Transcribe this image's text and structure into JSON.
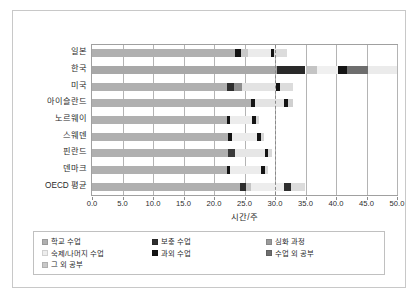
{
  "chart_data": {
    "type": "bar",
    "orientation": "horizontal",
    "stacked": true,
    "title": "",
    "subtitle": "",
    "xlabel": "시간/주",
    "ylabel": "",
    "xlim": [
      0.0,
      50.0
    ],
    "xticks": [
      "0.0",
      "5.0",
      "10.0",
      "15.0",
      "20.0",
      "25.0",
      "30.0",
      "35.0",
      "40.0",
      "45.0",
      "50.0"
    ],
    "xtick_values": [
      0,
      5,
      10,
      15,
      20,
      25,
      30,
      35,
      40,
      45,
      50
    ],
    "grid": true,
    "grid_axis": "x",
    "legend_position": "bottom",
    "annotations": [
      {
        "name": "reference-line",
        "type": "vertical-dashed",
        "value": 30.0,
        "color": "#8a8a8a"
      }
    ],
    "categories": [
      "일본",
      "한국",
      "미국",
      "아이슬란드",
      "노르웨이",
      "스웨덴",
      "핀란드",
      "덴마크",
      "OECD 평균"
    ],
    "series": [
      {
        "name": "학교 수업",
        "color": "#b0b0b0",
        "values": [
          23.4,
          30.4,
          22.1,
          26.0,
          22.1,
          22.3,
          22.3,
          22.1,
          24.3
        ]
      },
      {
        "name": "보충 수업",
        "color": "#404040",
        "values": [
          0.0,
          4.6,
          0.0,
          0.0,
          0.0,
          0.0,
          1.1,
          0.0,
          1.0
        ]
      },
      {
        "name": "심화 과정",
        "color": "#9a9a9a",
        "values": [
          0.0,
          0.0,
          0.9,
          0.0,
          0.0,
          0.0,
          0.0,
          0.0,
          0.0
        ]
      },
      {
        "name": "숙제/나머지 수업",
        "color": "#e8e8e8",
        "values": [
          4.6,
          2.1,
          7.5,
          5.2,
          4.2,
          4.7,
          4.5,
          5.1,
          5.3
        ]
      },
      {
        "name": "과외 수업",
        "color": "#141414",
        "values": [
          1.0,
          0.0,
          1.1,
          1.0,
          0.9,
          0.9,
          0.0,
          0.9,
          0.0
        ]
      },
      {
        "name": "수업 외 공부",
        "color": "#707070",
        "values": [
          0.0,
          3.5,
          0.0,
          0.0,
          0.0,
          0.0,
          0.0,
          0.0,
          0.0
        ]
      },
      {
        "name": "그 외 공부",
        "color": "#d5d5d5",
        "values": [
          2.6,
          9.4,
          1.4,
          0.8,
          0.0,
          0.3,
          0.6,
          0.2,
          2.6
        ]
      }
    ],
    "bars": [
      {
        "category": "일본",
        "segments": [
          {
            "series": "학교 수업",
            "start": 0.0,
            "end": 23.4,
            "color": "#b0b0b0"
          },
          {
            "series": "과외 수업",
            "start": 23.4,
            "end": 24.4,
            "color": "#141414"
          },
          {
            "series": "숙제/나머지 수업",
            "start": 24.4,
            "end": 25.6,
            "color": "#c9c9c9"
          },
          {
            "series": "그 외 공부",
            "start": 25.6,
            "end": 29.3,
            "color": "#ebebeb"
          },
          {
            "series": "과외 수업",
            "start": 29.3,
            "end": 29.9,
            "color": "#141414"
          },
          {
            "series": "그 외 공부",
            "start": 29.9,
            "end": 32.0,
            "color": "#dcdcdc"
          }
        ],
        "total": 32.0
      },
      {
        "category": "한국",
        "segments": [
          {
            "series": "학교 수업",
            "start": 0.0,
            "end": 30.4,
            "color": "#a8a8a8"
          },
          {
            "series": "보충 수업",
            "start": 30.4,
            "end": 35.0,
            "color": "#2a2a2a"
          },
          {
            "series": "숙제/나머지 수업",
            "start": 35.0,
            "end": 36.9,
            "color": "#c4c4c4"
          },
          {
            "series": "그 외 공부",
            "start": 36.9,
            "end": 40.3,
            "color": "#f0f0f0"
          },
          {
            "series": "과외 수업",
            "start": 40.3,
            "end": 41.8,
            "color": "#141414"
          },
          {
            "series": "수업 외 공부",
            "start": 41.8,
            "end": 45.2,
            "color": "#6e6e6e"
          },
          {
            "series": "그 외 공부",
            "start": 45.2,
            "end": 50.0,
            "color": "#ebebeb"
          }
        ],
        "total": 50.0
      },
      {
        "category": "미국",
        "segments": [
          {
            "series": "학교 수업",
            "start": 0.0,
            "end": 22.1,
            "color": "#b0b0b0"
          },
          {
            "series": "보충 수업",
            "start": 22.1,
            "end": 23.2,
            "color": "#2e2e2e"
          },
          {
            "series": "심화 과정",
            "start": 23.2,
            "end": 24.6,
            "color": "#8e8e8e"
          },
          {
            "series": "숙제/나머지 수업",
            "start": 24.6,
            "end": 30.2,
            "color": "#e3e3e3"
          },
          {
            "series": "과외 수업",
            "start": 30.2,
            "end": 30.9,
            "color": "#141414"
          },
          {
            "series": "그 외 공부",
            "start": 30.9,
            "end": 33.0,
            "color": "#dcdcdc"
          }
        ],
        "total": 33.0
      },
      {
        "category": "아이슬란드",
        "segments": [
          {
            "series": "학교 수업",
            "start": 0.0,
            "end": 26.0,
            "color": "#b0b0b0"
          },
          {
            "series": "과외 수업",
            "start": 26.0,
            "end": 26.7,
            "color": "#141414"
          },
          {
            "series": "숙제/나머지 수업",
            "start": 26.7,
            "end": 31.4,
            "color": "#e3e3e3"
          },
          {
            "series": "과외 수업",
            "start": 31.4,
            "end": 32.2,
            "color": "#141414"
          },
          {
            "series": "그 외 공부",
            "start": 32.2,
            "end": 33.0,
            "color": "#d0d0d0"
          }
        ],
        "total": 33.0
      },
      {
        "category": "노르웨이",
        "segments": [
          {
            "series": "학교 수업",
            "start": 0.0,
            "end": 22.1,
            "color": "#b0b0b0"
          },
          {
            "series": "과외 수업",
            "start": 22.1,
            "end": 22.6,
            "color": "#141414"
          },
          {
            "series": "숙제/나머지 수업",
            "start": 22.6,
            "end": 26.3,
            "color": "#ececec"
          },
          {
            "series": "과외 수업",
            "start": 26.3,
            "end": 26.9,
            "color": "#141414"
          },
          {
            "series": "그 외 공부",
            "start": 26.9,
            "end": 27.4,
            "color": "#d8d8d8"
          }
        ],
        "total": 27.4
      },
      {
        "category": "스웨덴",
        "segments": [
          {
            "series": "학교 수업",
            "start": 0.0,
            "end": 22.3,
            "color": "#b0b0b0"
          },
          {
            "series": "과외 수업",
            "start": 22.3,
            "end": 22.9,
            "color": "#141414"
          },
          {
            "series": "숙제/나머지 수업",
            "start": 22.9,
            "end": 27.1,
            "color": "#ececec"
          },
          {
            "series": "과외 수업",
            "start": 27.1,
            "end": 27.7,
            "color": "#141414"
          },
          {
            "series": "그 외 공부",
            "start": 27.7,
            "end": 28.2,
            "color": "#d8d8d8"
          }
        ],
        "total": 28.2
      },
      {
        "category": "핀란드",
        "segments": [
          {
            "series": "학교 수업",
            "start": 0.0,
            "end": 22.3,
            "color": "#b0b0b0"
          },
          {
            "series": "보충 수업",
            "start": 22.3,
            "end": 23.4,
            "color": "#3a3a3a"
          },
          {
            "series": "숙제/나머지 수업",
            "start": 23.4,
            "end": 28.3,
            "color": "#e6e6e6"
          },
          {
            "series": "과외 수업",
            "start": 28.3,
            "end": 28.9,
            "color": "#141414"
          },
          {
            "series": "그 외 공부",
            "start": 28.9,
            "end": 29.5,
            "color": "#d8d8d8"
          }
        ],
        "total": 29.5
      },
      {
        "category": "덴마크",
        "segments": [
          {
            "series": "학교 수업",
            "start": 0.0,
            "end": 22.1,
            "color": "#b0b0b0"
          },
          {
            "series": "과외 수업",
            "start": 22.1,
            "end": 22.7,
            "color": "#141414"
          },
          {
            "series": "숙제/나머지 수업",
            "start": 22.7,
            "end": 27.7,
            "color": "#ececec"
          },
          {
            "series": "과외 수업",
            "start": 27.7,
            "end": 28.3,
            "color": "#141414"
          },
          {
            "series": "그 외 공부",
            "start": 28.3,
            "end": 28.8,
            "color": "#d8d8d8"
          }
        ],
        "total": 28.8
      },
      {
        "category": "OECD 평균",
        "segments": [
          {
            "series": "학교 수업",
            "start": 0.0,
            "end": 24.3,
            "color": "#b0b0b0"
          },
          {
            "series": "보충 수업",
            "start": 24.3,
            "end": 25.3,
            "color": "#2e2e2e"
          },
          {
            "series": "숙제/나머지 수업",
            "start": 25.3,
            "end": 26.1,
            "color": "#c4c4c4"
          },
          {
            "series": "그 외 공부",
            "start": 26.1,
            "end": 31.4,
            "color": "#ededed"
          },
          {
            "series": "보충 수업",
            "start": 31.4,
            "end": 32.6,
            "color": "#2e2e2e"
          },
          {
            "series": "그 외 공부",
            "start": 32.6,
            "end": 35.0,
            "color": "#dcdcdc"
          }
        ],
        "total": 35.0
      }
    ],
    "legend": [
      {
        "label": "학교 수업",
        "color": "#b0b0b0",
        "col": 0,
        "row": 0
      },
      {
        "label": "숙제/나머지 수업",
        "color": "#ededed",
        "col": 0,
        "row": 1
      },
      {
        "label": "그 외 공부",
        "color": "#c8c8c8",
        "col": 0,
        "row": 2
      },
      {
        "label": "보충 수업",
        "color": "#2e2e2e",
        "col": 1,
        "row": 0
      },
      {
        "label": "과외 수업",
        "color": "#141414",
        "col": 1,
        "row": 1
      },
      {
        "label": "심화 과정",
        "color": "#9a9a9a",
        "col": 2,
        "row": 0
      },
      {
        "label": "수업 외 공부",
        "color": "#6e6e6e",
        "col": 2,
        "row": 1
      }
    ]
  }
}
